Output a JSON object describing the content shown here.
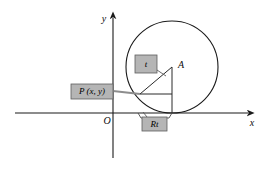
{
  "figure": {
    "kind": "geometry-diagram",
    "background_color": "#ffffff",
    "stroke_color": "#1a1a1a",
    "callout_fill": "#b5b5b5",
    "callout_stroke": "#5e5e5e"
  },
  "axes": {
    "y_label": "y",
    "x_label": "x",
    "origin_label": "O",
    "x_axis": {
      "x1": 15,
      "y1": 113,
      "x2": 248,
      "y2": 113
    },
    "y_axis": {
      "x1": 113,
      "y1": 158,
      "x2": 113,
      "y2": 18
    },
    "y_label_pos": {
      "x": 104,
      "y": 20
    },
    "x_label_pos": {
      "x": 252,
      "y": 124
    },
    "origin_label_pos": {
      "x": 107,
      "y": 122
    }
  },
  "circle": {
    "center": {
      "x": 172,
      "y": 67
    },
    "radius": 46,
    "touch_point": {
      "x": 172,
      "y": 113
    }
  },
  "points": {
    "A": {
      "label": "A",
      "x": 172,
      "y": 67,
      "label_x": 181,
      "label_y": 66
    },
    "P": {
      "label_text": "P (x, y)",
      "x": 140,
      "y": 94
    }
  },
  "segments": {
    "radius_to_P": {
      "x1": 172,
      "y1": 67,
      "x2": 140,
      "y2": 94
    },
    "vertical_radius": {
      "x1": 172,
      "y1": 67,
      "x2": 172,
      "y2": 113
    },
    "horizontal_from_P": {
      "x1": 140,
      "y1": 94,
      "x2": 172,
      "y2": 94
    }
  },
  "callouts": [
    {
      "id": "angle-t",
      "text": "t",
      "box": {
        "x": 135,
        "y": 55,
        "width": 22,
        "height": 18
      },
      "text_size": 9,
      "leader": {
        "x1": 157,
        "y1": 70,
        "x2": 166,
        "y2": 76
      }
    },
    {
      "id": "point-p",
      "text": "P (x, y)",
      "box": {
        "x": 71,
        "y": 84,
        "width": 42,
        "height": 15
      },
      "text_size": 9,
      "leader": {
        "x1": 113,
        "y1": 91,
        "x2": 140,
        "y2": 94
      }
    },
    {
      "id": "arc-length-rt",
      "text": "Rt",
      "box": {
        "x": 142,
        "y": 117,
        "width": 25,
        "height": 14
      },
      "text_size": 9,
      "leader": {
        "x1": 147,
        "y1": 117,
        "x2": 143,
        "y2": 112
      }
    }
  ],
  "brace": {
    "from_x": 138,
    "to_x": 172,
    "y": 113,
    "depth": 5
  }
}
